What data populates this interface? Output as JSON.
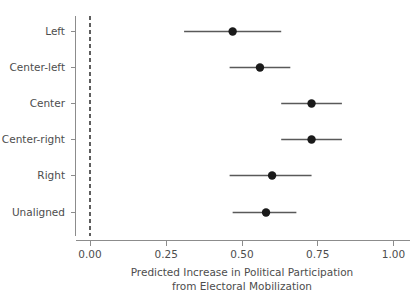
{
  "chart_data": {
    "type": "scatter",
    "title": "",
    "subtitle": "",
    "xlabel_line1": "Predicted Increase in Political Participation",
    "xlabel_line2": "from Electoral Mobilization",
    "ylabel": "",
    "xlim": [
      -0.05,
      1.05
    ],
    "xticks": [
      0.0,
      0.25,
      0.5,
      0.75,
      1.0
    ],
    "xtick_labels": [
      "0.00",
      "0.25",
      "0.50",
      "0.75",
      "1.00"
    ],
    "grid": false,
    "legend": null,
    "reference_line": {
      "x": 0.0,
      "style": "dashed",
      "color": "#1a1a1a"
    },
    "categories": [
      "Left",
      "Center-left",
      "Center",
      "Center-right",
      "Right",
      "Unaligned"
    ],
    "values": [
      0.47,
      0.56,
      0.73,
      0.73,
      0.6,
      0.58
    ],
    "ci_low": [
      0.31,
      0.46,
      0.63,
      0.63,
      0.46,
      0.47
    ],
    "ci_high": [
      0.63,
      0.66,
      0.83,
      0.83,
      0.73,
      0.68
    ],
    "points": [
      {
        "category": "Left",
        "estimate": 0.47,
        "ci_low": 0.31,
        "ci_high": 0.63
      },
      {
        "category": "Center-left",
        "estimate": 0.56,
        "ci_low": 0.46,
        "ci_high": 0.66
      },
      {
        "category": "Center",
        "estimate": 0.73,
        "ci_low": 0.63,
        "ci_high": 0.83
      },
      {
        "category": "Center-right",
        "estimate": 0.73,
        "ci_low": 0.63,
        "ci_high": 0.83
      },
      {
        "category": "Right",
        "estimate": 0.6,
        "ci_low": 0.46,
        "ci_high": 0.73
      },
      {
        "category": "Unaligned",
        "estimate": 0.58,
        "ci_low": 0.47,
        "ci_high": 0.68
      }
    ],
    "colors": {
      "point": "#1a1a1a",
      "interval": "#595959",
      "axis": "#8c8c8c",
      "text": "#4d4d4d",
      "background": "#ffffff"
    }
  }
}
